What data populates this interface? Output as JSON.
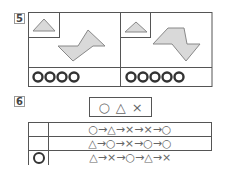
{
  "problem5": {
    "number": "5",
    "panels": [
      {
        "reference_shape": "triangle",
        "main_shape": "z-shaped-polygon-left",
        "answer_circles": [
          "O",
          "O",
          "O",
          "O"
        ],
        "answer_text": "OOOO"
      },
      {
        "reference_shape": "triangle",
        "main_shape": "z-shaped-polygon-right",
        "answer_circles": [
          "O",
          "O",
          "O",
          "O",
          "O"
        ],
        "answer_text": "OOOOO"
      }
    ],
    "colors": {
      "shape_fill": "#d9d9d9",
      "shape_stroke": "#888888",
      "border": "#555555",
      "circle": "#333333"
    }
  },
  "problem6": {
    "number": "6",
    "legend": [
      "○",
      "△",
      "×"
    ],
    "rows": [
      {
        "marked": false,
        "sequence": "○→△→×→×→○"
      },
      {
        "marked": false,
        "sequence": "△→○→×→○→○"
      },
      {
        "marked": true,
        "sequence": "△→×→○→△→×"
      }
    ]
  }
}
